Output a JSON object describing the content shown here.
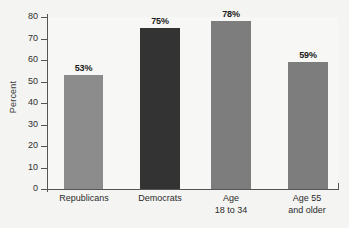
{
  "chart_data": {
    "type": "bar",
    "title": "",
    "xlabel": "",
    "ylabel": "Percent",
    "ylim": [
      0,
      80
    ],
    "ytick_step": 10,
    "yticks": [
      80,
      70,
      60,
      50,
      40,
      30,
      20,
      10,
      0
    ],
    "ytick_labels": [
      "80",
      "70",
      "60",
      "50",
      "40",
      "30",
      "20",
      "10",
      "0"
    ],
    "grid": false,
    "legend": "none",
    "categories": [
      "Republicans",
      "Democrats",
      "Age\n18 to 34",
      "Age 55\nand older"
    ],
    "values": [
      53,
      75,
      78,
      59
    ],
    "data_labels": [
      "53%",
      "75%",
      "78%",
      "59%"
    ],
    "bar_colors": [
      "#8c8c8c",
      "#333333",
      "#7d7d7d",
      "#7d7d7d"
    ],
    "bars": [
      {
        "label": "Republicans",
        "value": 53,
        "data_label": "53%",
        "color": "#8c8c8c"
      },
      {
        "label": "Democrats",
        "value": 75,
        "data_label": "75%",
        "color": "#333333"
      },
      {
        "label": "Age\n18 to 34",
        "value": 78,
        "data_label": "78%",
        "color": "#7d7d7d"
      },
      {
        "label": "Age 55\nand older",
        "value": 59,
        "data_label": "59%",
        "color": "#7d7d7d"
      }
    ]
  },
  "axis": {
    "y_title": "Percent"
  }
}
